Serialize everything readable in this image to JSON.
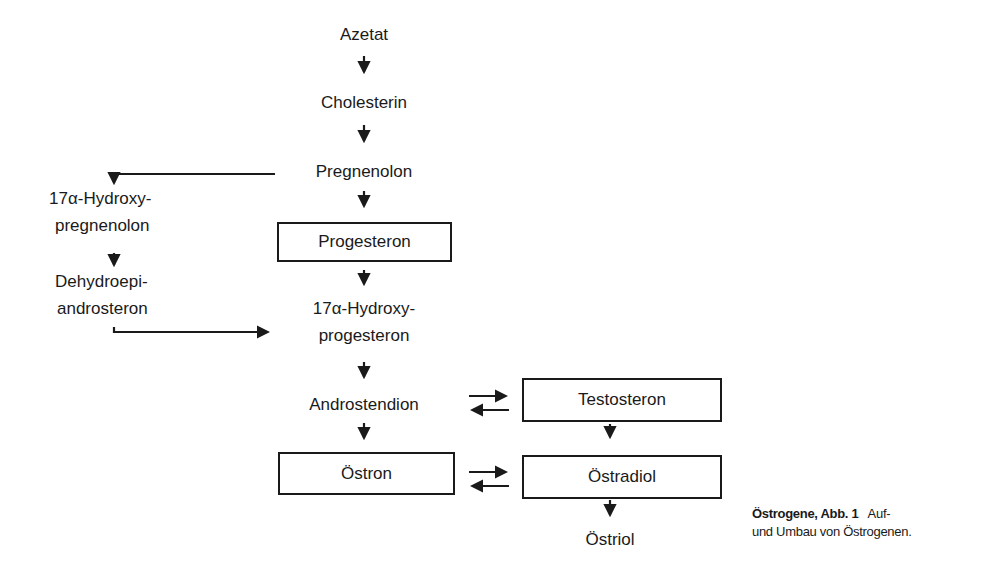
{
  "diagram": {
    "nodes": {
      "azetat": "Azetat",
      "cholesterin": "Cholesterin",
      "pregnenolon": "Pregnenolon",
      "hydroxypregnenolon_l1": "17α-Hydroxy-",
      "hydroxypregnenolon_l2": "pregnenolon",
      "progesteron": "Progesteron",
      "dhea_l1": "Dehydroepi-",
      "dhea_l2": "androsteron",
      "hydroxyprogesteron_l1": "17α-Hydroxy-",
      "hydroxyprogesteron_l2": "progesteron",
      "androstendion": "Androstendion",
      "testosteron": "Testosteron",
      "oestron": "Östron",
      "oestradiol": "Östradiol",
      "oestriol": "Östriol"
    },
    "edges": [
      {
        "from": "Azetat",
        "to": "Cholesterin",
        "type": "arrow"
      },
      {
        "from": "Cholesterin",
        "to": "Pregnenolon",
        "type": "arrow"
      },
      {
        "from": "Pregnenolon",
        "to": "17α-Hydroxy-pregnenolon",
        "type": "arrow"
      },
      {
        "from": "Pregnenolon",
        "to": "Progesteron",
        "type": "arrow"
      },
      {
        "from": "17α-Hydroxy-pregnenolon",
        "to": "Dehydroepi-androsteron",
        "type": "arrow"
      },
      {
        "from": "Dehydroepi-androsteron",
        "to": "17α-Hydroxy-progesteron",
        "type": "arrow"
      },
      {
        "from": "Progesteron",
        "to": "17α-Hydroxy-progesteron",
        "type": "arrow"
      },
      {
        "from": "17α-Hydroxy-progesteron",
        "to": "Androstendion",
        "type": "arrow"
      },
      {
        "from": "Androstendion",
        "to": "Testosteron",
        "type": "reversible"
      },
      {
        "from": "Androstendion",
        "to": "Östron",
        "type": "arrow"
      },
      {
        "from": "Testosteron",
        "to": "Östradiol",
        "type": "arrow"
      },
      {
        "from": "Östron",
        "to": "Östradiol",
        "type": "reversible"
      },
      {
        "from": "Östradiol",
        "to": "Östriol",
        "type": "arrow"
      }
    ]
  },
  "caption": {
    "bold": "Östrogene, Abb. 1",
    "line1": "Auf-",
    "line2": "und Umbau von Östrogenen."
  }
}
